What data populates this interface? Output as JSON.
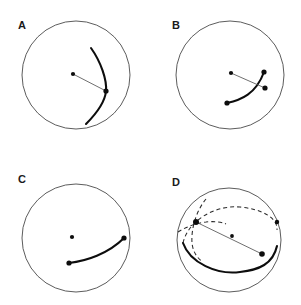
{
  "figure": {
    "type": "geometric-diagram",
    "width": 301,
    "height": 305,
    "background_color": "#ffffff",
    "stroke_color": "#4a4a4a",
    "geodesic_color": "#0d0d0d",
    "radial_color": "#555555",
    "dashed_color": "#2b2b2b"
  },
  "panels": [
    {
      "id": "panel-a",
      "label": "A",
      "label_x": 18,
      "label_y": 29,
      "boundary": {
        "shape": "circle",
        "cx": 76,
        "cy": 75,
        "r": 54
      },
      "center_node": {
        "x": 73,
        "y": 74,
        "r": 2.1
      },
      "vertex_node": {
        "x": 106,
        "y": 91,
        "r": 2.6
      },
      "radial_line": {
        "x1": 73,
        "y1": 74,
        "x2": 106,
        "y2": 91
      },
      "geodesic_path": "M 91 48 C 101 62 107 80 106 91 C 105 102 96 114 86 124",
      "has_radial_line": true,
      "has_center_node": true
    },
    {
      "id": "panel-b",
      "label": "B",
      "label_x": 172,
      "label_y": 29,
      "boundary": {
        "shape": "circle",
        "cx": 230,
        "cy": 75,
        "r": 54
      },
      "center_node": {
        "x": 231,
        "y": 73,
        "r": 2.1
      },
      "vertex_node": {
        "x": 265,
        "y": 88,
        "r": 2.6
      },
      "endpoint_nodes": [
        {
          "x": 227,
          "y": 103,
          "r": 2.6
        },
        {
          "x": 264,
          "y": 72,
          "r": 2.6
        }
      ],
      "radial_line": {
        "x1": 231,
        "y1": 73,
        "x2": 265,
        "y2": 88
      },
      "geodesic_path": "M 227 103 C 241 100 256 94 264 72",
      "has_radial_line": true,
      "has_center_node": true
    },
    {
      "id": "panel-c",
      "label": "C",
      "label_x": 18,
      "label_y": 183,
      "boundary": {
        "shape": "circle",
        "cx": 76,
        "cy": 238,
        "r": 54
      },
      "center_node": {
        "x": 72,
        "y": 237,
        "r": 2.1
      },
      "endpoint_nodes": [
        {
          "x": 69,
          "y": 263,
          "r": 2.6
        },
        {
          "x": 124,
          "y": 238,
          "r": 2.6
        }
      ],
      "geodesic_path": "M 69 263 C 86 261 108 254 124 238",
      "has_radial_line": false,
      "has_center_node": true
    },
    {
      "id": "panel-d",
      "label": "D",
      "label_x": 172,
      "label_y": 186,
      "boundary": {
        "shape": "circle",
        "cx": 229,
        "cy": 240,
        "r": 52
      },
      "center_node": {
        "x": 232,
        "y": 236,
        "r": 1.9
      },
      "junction_node": {
        "x": 196,
        "y": 222,
        "r": 3.0
      },
      "endpoint_nodes": [
        {
          "x": 262,
          "y": 254,
          "r": 2.8
        },
        {
          "x": 277,
          "y": 222,
          "r": 2.2
        }
      ],
      "equator_hidden_path": "M 183 243 C 188 221 214 205 240 207 C 262 209 278 218 277 230",
      "equator_visible_path": "M 183 243 C 190 263 217 275 240 272 C 259 270 273 264 277 246",
      "meridian_hidden_path": "M 206 199 C 196 211 191 229 192 243 C 193 252 197 258 203 262",
      "meridian_hidden_path2": "M 178 232 C 186 227 196 223 206 222 C 214 221 221 222 226 224",
      "radial_line_1": {
        "x1": 196,
        "y1": 222,
        "x2": 262,
        "y2": 254
      },
      "radial_line_2": {
        "x1": 232,
        "y1": 236,
        "x2": 262,
        "y2": 254
      },
      "has_radial_line": true,
      "has_center_node": true,
      "is_sphere": true
    }
  ]
}
